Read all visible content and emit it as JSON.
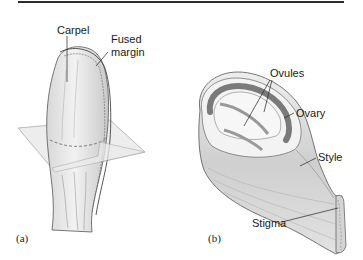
{
  "figure": {
    "panels": [
      {
        "id": "a",
        "label": "(a)",
        "callouts": {
          "carpel": "Carpel",
          "fused_margin_line1": "Fused",
          "fused_margin_line2": "margin"
        }
      },
      {
        "id": "b",
        "label": "(b)",
        "callouts": {
          "ovules": "Ovules",
          "ovary": "Ovary",
          "style": "Style",
          "stigma": "Stigma"
        }
      }
    ],
    "colors": {
      "rule": "#2b2b2b",
      "tissue_fill": "#e4e4e4",
      "tissue_dark": "#8a8a8a",
      "plane_fill": "#ececec",
      "outline": "#555555"
    }
  }
}
